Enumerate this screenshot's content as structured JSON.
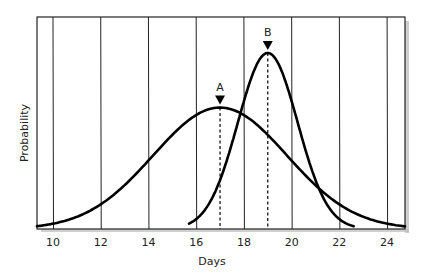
{
  "chart_data": {
    "type": "line",
    "title": "",
    "xlabel": "Days",
    "ylabel": "Probability",
    "xlim": [
      9.33,
      24.75
    ],
    "ylim": [
      0,
      1.0
    ],
    "x_ticks": [
      10,
      12,
      14,
      16,
      18,
      20,
      22,
      24
    ],
    "x_tick_labels": [
      "10",
      "12",
      "14",
      "16",
      "18",
      "20",
      "22",
      "24"
    ],
    "grid": "vertical",
    "y_ticks_shown": false,
    "series": [
      {
        "name": "A",
        "distribution": "normal",
        "mean": 17.0,
        "sigma": 2.8,
        "peak": 0.69,
        "x_range": [
          9.33,
          24.75
        ]
      },
      {
        "name": "B",
        "distribution": "normal",
        "mean": 19.0,
        "sigma": 1.25,
        "peak": 1.0,
        "x_range": [
          15.7,
          22.6
        ]
      }
    ],
    "annotations": [
      {
        "label": "A",
        "x": 17.0,
        "style": "dashed-vertical-with-triangle-marker"
      },
      {
        "label": "B",
        "x": 19.0,
        "style": "dashed-vertical-with-triangle-marker"
      }
    ]
  },
  "colors": {
    "line": "#000000",
    "grid": "#222222",
    "shadow": "#bbbbbb",
    "background": "#ffffff"
  }
}
